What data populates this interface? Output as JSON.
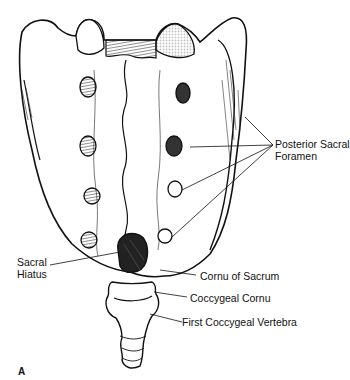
{
  "figure": {
    "panel_label": "A",
    "labels": {
      "posterior_sacral_foramen": [
        "Posterior Sacral",
        "Foramen"
      ],
      "sacral_hiatus": [
        "Sacral",
        "Hiatus"
      ],
      "cornu_of_sacrum": "Cornu of Sacrum",
      "coccygeal_cornu": "Coccygeal Cornu",
      "first_coccygeal_vertebra": "First Coccygeal Vertebra"
    },
    "colors": {
      "ink": "#111111",
      "background": "#ffffff"
    }
  }
}
